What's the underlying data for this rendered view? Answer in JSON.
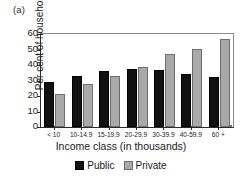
{
  "panel": {
    "label": "(a)"
  },
  "colors": {
    "public": "#111111",
    "private": "#a9a9a9",
    "axis": "#2a2a2a",
    "frame": "#8a8a8a",
    "background": "#ffffff"
  },
  "chart_data": {
    "type": "bar",
    "title": "",
    "subtitle": "",
    "xlabel": "Income class (in thousands)",
    "ylabel": "Per cent of households",
    "categories": [
      "< 10",
      "10-14.9",
      "15-19.9",
      "20-29.9",
      "30-39.9",
      "40-59.9",
      "60 +"
    ],
    "series": [
      {
        "name": "Public",
        "color": "#111111",
        "values": [
          29,
          33,
          36,
          37.5,
          37,
          34.5,
          32.5
        ]
      },
      {
        "name": "Private",
        "color": "#a9a9a9",
        "values": [
          21.5,
          27.5,
          33,
          39,
          47,
          50.5,
          56.5
        ]
      }
    ],
    "ylim": [
      0,
      60
    ],
    "ytick_step": 10,
    "yticks": [
      0,
      10,
      20,
      30,
      40,
      50,
      60
    ],
    "ytick_labels": [
      "0",
      "10",
      "20",
      "30",
      "40",
      "50",
      "60"
    ],
    "grid": false,
    "legend_position": "bottom-center",
    "legend_entries": [
      "Public",
      "Private"
    ]
  }
}
